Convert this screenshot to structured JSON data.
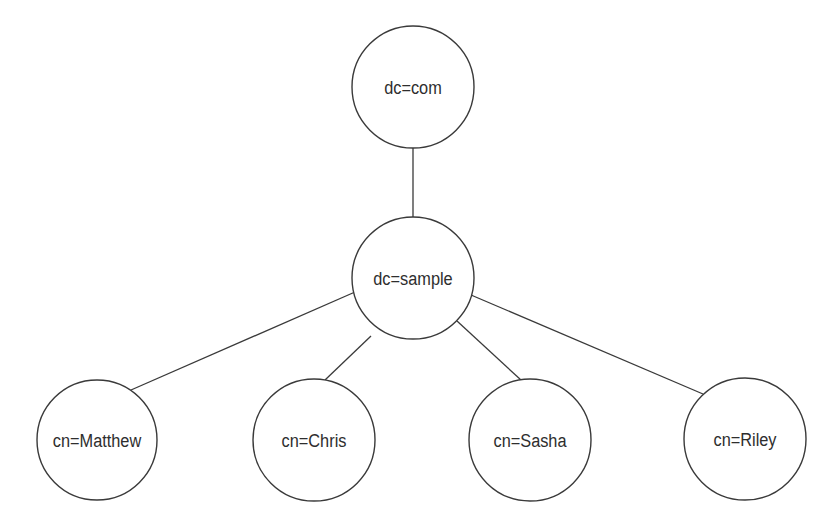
{
  "diagram": {
    "type": "tree",
    "nodes": [
      {
        "id": "com",
        "label": "dc=com",
        "cx": 413,
        "cy": 87,
        "r": 61
      },
      {
        "id": "sample",
        "label": "dc=sample",
        "cx": 413,
        "cy": 278,
        "r": 61
      },
      {
        "id": "matthew",
        "label": "cn=Matthew",
        "cx": 97,
        "cy": 440,
        "r": 60
      },
      {
        "id": "chris",
        "label": "cn=Chris",
        "cx": 314,
        "cy": 440,
        "r": 61
      },
      {
        "id": "sasha",
        "label": "cn=Sasha",
        "cx": 530,
        "cy": 440,
        "r": 61
      },
      {
        "id": "riley",
        "label": "cn=Riley",
        "cx": 745,
        "cy": 439,
        "r": 61
      }
    ],
    "edges": [
      {
        "from": "com",
        "to": "sample"
      },
      {
        "from": "sample",
        "to": "matthew"
      },
      {
        "from": "sample",
        "to": "chris"
      },
      {
        "from": "sample",
        "to": "sasha"
      },
      {
        "from": "sample",
        "to": "riley"
      }
    ]
  }
}
